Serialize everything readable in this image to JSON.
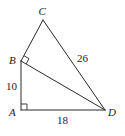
{
  "figure": {
    "type": "geometry",
    "vertices": {
      "A": {
        "label": "A",
        "x": 21,
        "y": 110
      },
      "B": {
        "label": "B",
        "x": 21,
        "y": 61
      },
      "C": {
        "label": "C",
        "x": 43,
        "y": 20
      },
      "D": {
        "label": "D",
        "x": 105,
        "y": 110
      }
    },
    "segments": [
      {
        "name": "AB",
        "from": "A",
        "to": "B",
        "length_label": "10"
      },
      {
        "name": "AD",
        "from": "A",
        "to": "D",
        "length_label": "18"
      },
      {
        "name": "CD",
        "from": "C",
        "to": "D",
        "length_label": "26"
      },
      {
        "name": "BC",
        "from": "B",
        "to": "C",
        "length_label": ""
      },
      {
        "name": "BD",
        "from": "B",
        "to": "D",
        "length_label": ""
      }
    ],
    "right_angles": [
      "A",
      "B"
    ],
    "labels": {
      "A": "A",
      "B": "B",
      "C": "C",
      "D": "D",
      "AB": "10",
      "AD": "18",
      "CD": "26"
    },
    "colors": {
      "stroke": "#2a2a2a",
      "text": "#222222",
      "background": "#ffffff"
    }
  }
}
